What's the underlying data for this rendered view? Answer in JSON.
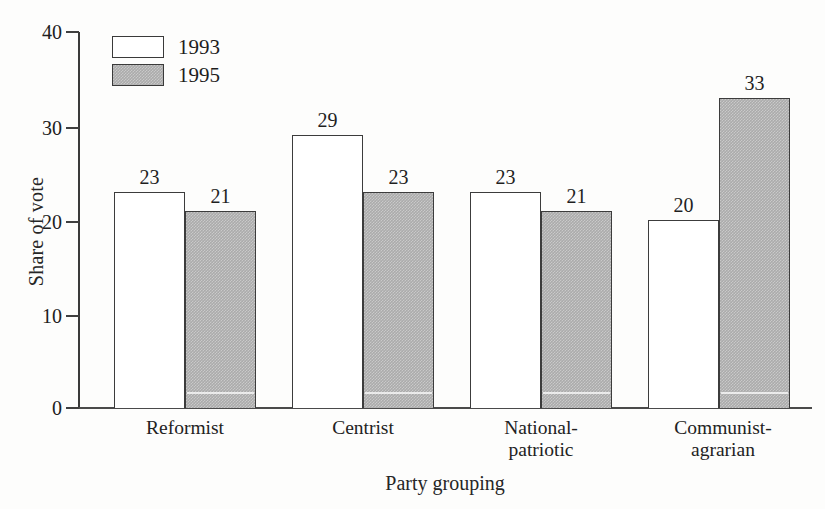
{
  "chart_data": {
    "type": "bar",
    "title": "",
    "xlabel": "Party grouping",
    "ylabel": "Share of vote",
    "categories": [
      "Reformist",
      "Centrist",
      "National-patriotic",
      "Communist-agrarian"
    ],
    "category_lines": [
      [
        "Reformist"
      ],
      [
        "Centrist"
      ],
      [
        "National-",
        "patriotic"
      ],
      [
        "Communist-",
        "agrarian"
      ]
    ],
    "series": [
      {
        "name": "1993",
        "values": [
          23,
          29,
          23,
          20
        ],
        "fill": "#ffffff",
        "stroke": "#3c3c3c"
      },
      {
        "name": "1995",
        "values": [
          21,
          23,
          21,
          33
        ],
        "fill": "#ababab",
        "stroke": "#3c3c3c"
      }
    ],
    "ylim": [
      0,
      40
    ],
    "yticks": [
      0,
      10,
      20,
      30,
      40
    ],
    "ytick_labels": [
      "0",
      "10",
      "20",
      "30",
      "40"
    ],
    "grid": false,
    "legend_position": "top-left",
    "data_labels": true
  },
  "legend": {
    "items": [
      {
        "label": "1993",
        "swatch": "white-square-icon"
      },
      {
        "label": "1995",
        "swatch": "gray-square-icon"
      }
    ]
  },
  "axis": {
    "y_title": "Share of vote",
    "x_title": "Party grouping",
    "y_tick_0": "0",
    "y_tick_1": "10",
    "y_tick_2": "20",
    "y_tick_3": "30",
    "y_tick_4": "40"
  },
  "bars": [
    {
      "group": "Reformist",
      "series": "1993",
      "value": "23"
    },
    {
      "group": "Reformist",
      "series": "1995",
      "value": "21"
    },
    {
      "group": "Centrist",
      "series": "1993",
      "value": "29"
    },
    {
      "group": "Centrist",
      "series": "1995",
      "value": "23"
    },
    {
      "group": "National-patriotic",
      "series": "1993",
      "value": "23"
    },
    {
      "group": "National-patriotic",
      "series": "1995",
      "value": "21"
    },
    {
      "group": "Communist-agrarian",
      "series": "1993",
      "value": "20"
    },
    {
      "group": "Communist-agrarian",
      "series": "1995",
      "value": "33"
    }
  ]
}
